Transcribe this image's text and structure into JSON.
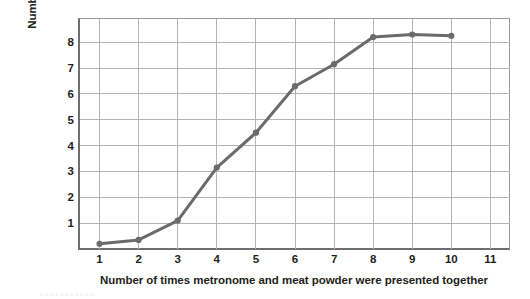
{
  "chart_data": {
    "type": "line",
    "title": "",
    "xlabel": "Number of times metronome and meat powder were presented together",
    "ylabel_line1": "Number of drops of saliva elicited",
    "ylabel_line2": "by metronome alone",
    "x": [
      1,
      2,
      3,
      4,
      5,
      6,
      7,
      8,
      9,
      10
    ],
    "values": [
      0.2,
      0.35,
      1.1,
      3.15,
      4.5,
      6.3,
      7.15,
      8.2,
      8.3,
      8.25
    ],
    "xlim": [
      0.5,
      11.5
    ],
    "ylim": [
      0,
      8.9
    ],
    "xticks": [
      "1",
      "2",
      "3",
      "4",
      "5",
      "6",
      "7",
      "8",
      "9",
      "10",
      "11"
    ],
    "xtick_values": [
      1,
      2,
      3,
      4,
      5,
      6,
      7,
      8,
      9,
      10,
      11
    ],
    "yticks": [
      "1",
      "2",
      "3",
      "4",
      "5",
      "6",
      "7",
      "8"
    ],
    "ytick_values": [
      1,
      2,
      3,
      4,
      5,
      6,
      7,
      8
    ],
    "grid": true,
    "legend": "none",
    "series_name": "drops of saliva",
    "marker": "circle",
    "colors": {
      "line": "#6b6b6b",
      "marker": "#6b6b6b",
      "grid": "#b5b5b5",
      "axis": "#6f6f6f",
      "frame": "#9a9a9a",
      "text": "#231f20",
      "background": "#ffffff"
    }
  },
  "bleed": {
    "ghost_text": "a             a     a   a    a    a       a     a      a    a      a"
  }
}
